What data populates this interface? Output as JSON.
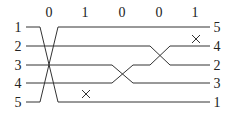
{
  "diagram": {
    "type": "sorting-network / permutation diagram",
    "top_labels": [
      "0",
      "1",
      "0",
      "0",
      "1"
    ],
    "left_labels": [
      "1",
      "2",
      "3",
      "4",
      "5"
    ],
    "right_labels": [
      "5",
      "4",
      "2",
      "3",
      "1"
    ],
    "colors": {
      "line": "#333333",
      "text": "#222222",
      "background": "#ffffff"
    },
    "marks": [
      {
        "symbol": "×",
        "column": 2,
        "description": "no swap mark below row 4"
      },
      {
        "symbol": "×",
        "column": 5,
        "description": "no swap mark between rows 1 and 2"
      }
    ]
  }
}
